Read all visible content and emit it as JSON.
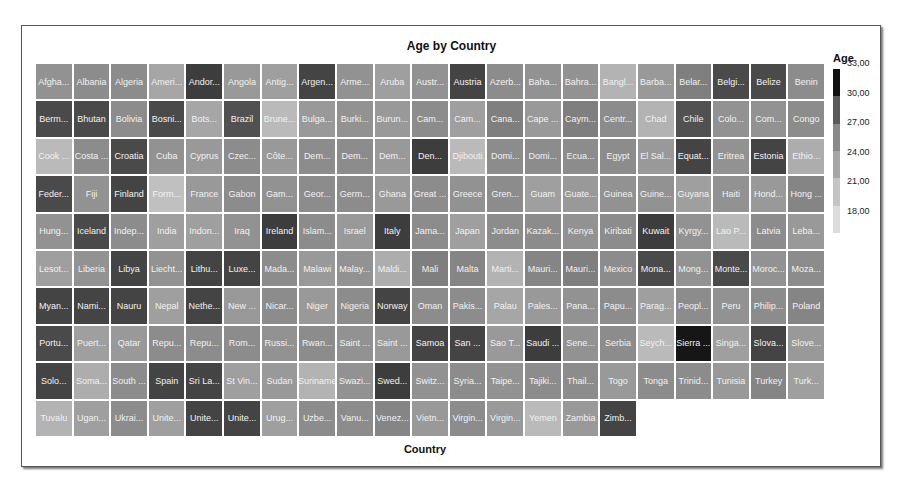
{
  "chart_data": {
    "type": "heatmap",
    "subtype": "treemap-grid",
    "title": "Age by Country",
    "xlabel": "Country",
    "legend": {
      "title": "Age",
      "ticks": [
        "33,00",
        "30,00",
        "27,00",
        "24,00",
        "21,00",
        "18,00"
      ],
      "range": [
        18,
        34
      ],
      "colors": [
        "#111111",
        "#5a5a5a",
        "#8a8a8a",
        "#a6a6a6",
        "#c4c4c4",
        "#dcdcdc"
      ]
    },
    "columns": 21,
    "cells": [
      {
        "label": "Afgha...",
        "value": 24.0
      },
      {
        "label": "Albania",
        "value": 24.5
      },
      {
        "label": "Algeria",
        "value": 24.5
      },
      {
        "label": "Ameri...",
        "value": 22.5
      },
      {
        "label": "Andor...",
        "value": 30.5
      },
      {
        "label": "Angola",
        "value": 23.5
      },
      {
        "label": "Antig...",
        "value": 23.0
      },
      {
        "label": "Argen...",
        "value": 30.0
      },
      {
        "label": "Arme...",
        "value": 24.0
      },
      {
        "label": "Aruba",
        "value": 23.0
      },
      {
        "label": "Austr...",
        "value": 24.0
      },
      {
        "label": "Austria",
        "value": 30.0
      },
      {
        "label": "Azerb...",
        "value": 24.5
      },
      {
        "label": "Baha...",
        "value": 24.0
      },
      {
        "label": "Bahra...",
        "value": 24.0
      },
      {
        "label": "Bangl...",
        "value": 21.5
      },
      {
        "label": "Barba...",
        "value": 23.5
      },
      {
        "label": "Belar...",
        "value": 25.5
      },
      {
        "label": "Belgi...",
        "value": 29.5
      },
      {
        "label": "Belize",
        "value": 29.5
      },
      {
        "label": "Benin",
        "value": 24.5
      },
      {
        "label": "Berm...",
        "value": 29.5
      },
      {
        "label": "Bhutan",
        "value": 29.5
      },
      {
        "label": "Bolivia",
        "value": 24.5
      },
      {
        "label": "Bosni...",
        "value": 29.5
      },
      {
        "label": "Bots...",
        "value": 22.5
      },
      {
        "label": "Brazil",
        "value": 29.0
      },
      {
        "label": "Brune...",
        "value": 21.0
      },
      {
        "label": "Bulga...",
        "value": 23.5
      },
      {
        "label": "Burki...",
        "value": 24.0
      },
      {
        "label": "Burun...",
        "value": 23.5
      },
      {
        "label": "Cam...",
        "value": 24.5
      },
      {
        "label": "Cam...",
        "value": 23.0
      },
      {
        "label": "Cana...",
        "value": 25.5
      },
      {
        "label": "Cape ...",
        "value": 23.5
      },
      {
        "label": "Caym...",
        "value": 25.5
      },
      {
        "label": "Centr...",
        "value": 24.5
      },
      {
        "label": "Chad",
        "value": 21.5
      },
      {
        "label": "Chile",
        "value": 29.0
      },
      {
        "label": "Colo...",
        "value": 24.0
      },
      {
        "label": "Com...",
        "value": 24.0
      },
      {
        "label": "Congo",
        "value": 24.5
      },
      {
        "label": "Cook ...",
        "value": 21.0
      },
      {
        "label": "Costa ...",
        "value": 24.5
      },
      {
        "label": "Croatia",
        "value": 29.5
      },
      {
        "label": "Cuba",
        "value": 24.0
      },
      {
        "label": "Cyprus",
        "value": 23.5
      },
      {
        "label": "Czec...",
        "value": 24.5
      },
      {
        "label": "Côte...",
        "value": 23.5
      },
      {
        "label": "Dem...",
        "value": 24.5
      },
      {
        "label": "Dem...",
        "value": 24.5
      },
      {
        "label": "Dem...",
        "value": 23.5
      },
      {
        "label": "Den...",
        "value": 30.5
      },
      {
        "label": "Djibouti",
        "value": 21.0
      },
      {
        "label": "Domi...",
        "value": 24.5
      },
      {
        "label": "Domi...",
        "value": 24.5
      },
      {
        "label": "Ecua...",
        "value": 24.5
      },
      {
        "label": "Egypt",
        "value": 24.5
      },
      {
        "label": "El Sal...",
        "value": 23.5
      },
      {
        "label": "Equat...",
        "value": 30.0
      },
      {
        "label": "Eritrea",
        "value": 24.0
      },
      {
        "label": "Estonia",
        "value": 30.0
      },
      {
        "label": "Ethio...",
        "value": 22.0
      },
      {
        "label": "Feder...",
        "value": 29.5
      },
      {
        "label": "Fiji",
        "value": 24.0
      },
      {
        "label": "Finland",
        "value": 30.0
      },
      {
        "label": "Form...",
        "value": 20.5
      },
      {
        "label": "France",
        "value": 23.5
      },
      {
        "label": "Gabon",
        "value": 24.5
      },
      {
        "label": "Gam...",
        "value": 24.0
      },
      {
        "label": "Geor...",
        "value": 24.5
      },
      {
        "label": "Germ...",
        "value": 24.5
      },
      {
        "label": "Ghana",
        "value": 23.5
      },
      {
        "label": "Great ...",
        "value": 24.5
      },
      {
        "label": "Greece",
        "value": 24.0
      },
      {
        "label": "Gren...",
        "value": 24.5
      },
      {
        "label": "Guam",
        "value": 23.0
      },
      {
        "label": "Guate...",
        "value": 23.5
      },
      {
        "label": "Guinea",
        "value": 24.0
      },
      {
        "label": "Guine...",
        "value": 24.0
      },
      {
        "label": "Guyana",
        "value": 23.0
      },
      {
        "label": "Haiti",
        "value": 24.0
      },
      {
        "label": "Hond...",
        "value": 23.5
      },
      {
        "label": "Hong ...",
        "value": 25.0
      },
      {
        "label": "Hung...",
        "value": 24.0
      },
      {
        "label": "Iceland",
        "value": 29.5
      },
      {
        "label": "Indep...",
        "value": 24.5
      },
      {
        "label": "India",
        "value": 23.0
      },
      {
        "label": "Indon...",
        "value": 23.0
      },
      {
        "label": "Iraq",
        "value": 24.0
      },
      {
        "label": "Ireland",
        "value": 30.5
      },
      {
        "label": "Islam...",
        "value": 24.5
      },
      {
        "label": "Israel",
        "value": 23.5
      },
      {
        "label": "Italy",
        "value": 30.5
      },
      {
        "label": "Jama...",
        "value": 24.5
      },
      {
        "label": "Japan",
        "value": 23.0
      },
      {
        "label": "Jordan",
        "value": 24.5
      },
      {
        "label": "Kazak...",
        "value": 24.5
      },
      {
        "label": "Kenya",
        "value": 24.0
      },
      {
        "label": "Kiribati",
        "value": 24.5
      },
      {
        "label": "Kuwait",
        "value": 30.5
      },
      {
        "label": "Kyrgy...",
        "value": 24.0
      },
      {
        "label": "Lao P...",
        "value": 21.0
      },
      {
        "label": "Latvia",
        "value": 24.5
      },
      {
        "label": "Leba...",
        "value": 23.5
      },
      {
        "label": "Lesot...",
        "value": 23.0
      },
      {
        "label": "Liberia",
        "value": 24.0
      },
      {
        "label": "Libya",
        "value": 30.0
      },
      {
        "label": "Liecht...",
        "value": 24.0
      },
      {
        "label": "Lithu...",
        "value": 30.0
      },
      {
        "label": "Luxe...",
        "value": 30.0
      },
      {
        "label": "Mada...",
        "value": 24.5
      },
      {
        "label": "Malawi",
        "value": 23.5
      },
      {
        "label": "Malay...",
        "value": 24.0
      },
      {
        "label": "Maldi...",
        "value": 22.0
      },
      {
        "label": "Mali",
        "value": 25.5
      },
      {
        "label": "Malta",
        "value": 25.0
      },
      {
        "label": "Marti...",
        "value": 21.5
      },
      {
        "label": "Mauri...",
        "value": 25.0
      },
      {
        "label": "Mauri...",
        "value": 25.5
      },
      {
        "label": "Mexico",
        "value": 24.5
      },
      {
        "label": "Mona...",
        "value": 29.5
      },
      {
        "label": "Mong...",
        "value": 24.0
      },
      {
        "label": "Monte...",
        "value": 29.5
      },
      {
        "label": "Moroc...",
        "value": 24.0
      },
      {
        "label": "Moza...",
        "value": 24.5
      },
      {
        "label": "Myan...",
        "value": 30.0
      },
      {
        "label": "Nami...",
        "value": 30.0
      },
      {
        "label": "Nauru",
        "value": 30.0
      },
      {
        "label": "Nepal",
        "value": 23.0
      },
      {
        "label": "Nethe...",
        "value": 30.0
      },
      {
        "label": "New ...",
        "value": 23.5
      },
      {
        "label": "Nicar...",
        "value": 24.5
      },
      {
        "label": "Niger",
        "value": 23.5
      },
      {
        "label": "Nigeria",
        "value": 24.5
      },
      {
        "label": "Norway",
        "value": 30.0
      },
      {
        "label": "Oman",
        "value": 24.5
      },
      {
        "label": "Pakis...",
        "value": 24.5
      },
      {
        "label": "Palau",
        "value": 22.5
      },
      {
        "label": "Pales...",
        "value": 23.5
      },
      {
        "label": "Pana...",
        "value": 24.0
      },
      {
        "label": "Papu...",
        "value": 24.5
      },
      {
        "label": "Parag...",
        "value": 23.0
      },
      {
        "label": "Peopl...",
        "value": 24.5
      },
      {
        "label": "Peru",
        "value": 24.0
      },
      {
        "label": "Philip...",
        "value": 24.5
      },
      {
        "label": "Poland",
        "value": 25.0
      },
      {
        "label": "Portu...",
        "value": 29.5
      },
      {
        "label": "Puert...",
        "value": 23.0
      },
      {
        "label": "Qatar",
        "value": 23.5
      },
      {
        "label": "Repu...",
        "value": 24.5
      },
      {
        "label": "Repu...",
        "value": 24.5
      },
      {
        "label": "Rom...",
        "value": 24.5
      },
      {
        "label": "Russi...",
        "value": 24.0
      },
      {
        "label": "Rwan...",
        "value": 24.5
      },
      {
        "label": "Saint ...",
        "value": 24.0
      },
      {
        "label": "Saint ...",
        "value": 23.5
      },
      {
        "label": "Samoa",
        "value": 30.0
      },
      {
        "label": "San ...",
        "value": 30.0
      },
      {
        "label": "Sao T...",
        "value": 23.5
      },
      {
        "label": "Saudi ...",
        "value": 30.5
      },
      {
        "label": "Sene...",
        "value": 24.0
      },
      {
        "label": "Serbia",
        "value": 24.5
      },
      {
        "label": "Seych...",
        "value": 21.0
      },
      {
        "label": "Sierra ...",
        "value": 33.5
      },
      {
        "label": "Singa...",
        "value": 23.0
      },
      {
        "label": "Slova...",
        "value": 30.0
      },
      {
        "label": "Slove...",
        "value": 23.5
      },
      {
        "label": "Solo...",
        "value": 30.0
      },
      {
        "label": "Soma...",
        "value": 22.0
      },
      {
        "label": "South ...",
        "value": 24.5
      },
      {
        "label": "Spain",
        "value": 30.0
      },
      {
        "label": "Sri La...",
        "value": 30.0
      },
      {
        "label": "St Vin...",
        "value": 23.0
      },
      {
        "label": "Sudan",
        "value": 23.5
      },
      {
        "label": "Suriname",
        "value": 21.5
      },
      {
        "label": "Swazi...",
        "value": 24.0
      },
      {
        "label": "Swed...",
        "value": 30.5
      },
      {
        "label": "Switz...",
        "value": 24.0
      },
      {
        "label": "Syria...",
        "value": 24.5
      },
      {
        "label": "Taipe...",
        "value": 24.0
      },
      {
        "label": "Tajiki...",
        "value": 24.5
      },
      {
        "label": "Thail...",
        "value": 24.5
      },
      {
        "label": "Togo",
        "value": 23.5
      },
      {
        "label": "Tonga",
        "value": 24.5
      },
      {
        "label": "Trinid...",
        "value": 24.5
      },
      {
        "label": "Tunisia",
        "value": 23.5
      },
      {
        "label": "Turkey",
        "value": 25.0
      },
      {
        "label": "Turk...",
        "value": 23.0
      },
      {
        "label": "Tuvalu",
        "value": 21.5
      },
      {
        "label": "Ugan...",
        "value": 23.0
      },
      {
        "label": "Ukrai...",
        "value": 24.5
      },
      {
        "label": "Unite...",
        "value": 23.0
      },
      {
        "label": "Unite...",
        "value": 30.0
      },
      {
        "label": "Unite...",
        "value": 30.0
      },
      {
        "label": "Urug...",
        "value": 23.0
      },
      {
        "label": "Uzbe...",
        "value": 24.5
      },
      {
        "label": "Vanu...",
        "value": 24.5
      },
      {
        "label": "Venez...",
        "value": 25.0
      },
      {
        "label": "Vietn...",
        "value": 23.5
      },
      {
        "label": "Virgin...",
        "value": 24.5
      },
      {
        "label": "Virgin...",
        "value": 23.5
      },
      {
        "label": "Yemen",
        "value": 21.0
      },
      {
        "label": "Zambia",
        "value": 23.5
      },
      {
        "label": "Zimb...",
        "value": 30.0
      }
    ]
  }
}
